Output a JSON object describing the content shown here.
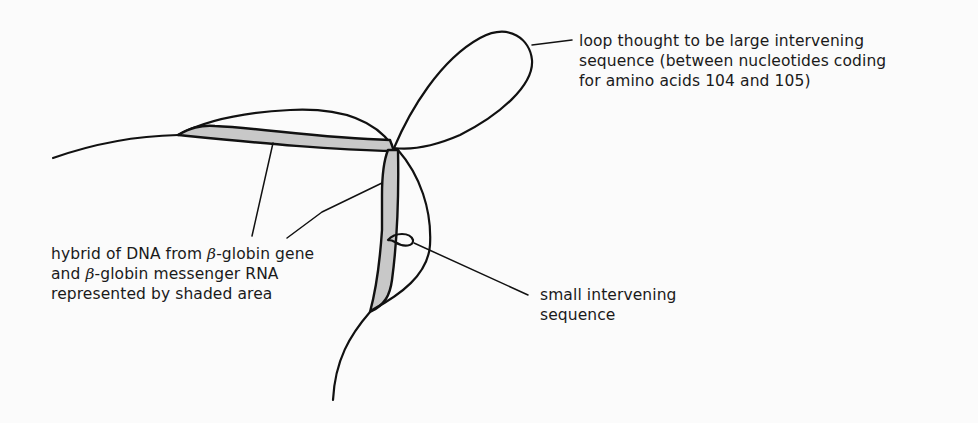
{
  "diagram": {
    "colors": {
      "stroke": "#111111",
      "shade": "#c8c8c8",
      "background": "#fbfbfb"
    },
    "labels": {
      "large_loop": {
        "lines": [
          "loop thought to be large intervening",
          "sequence (between nucleotides coding",
          "for amino acids 104 and 105)"
        ]
      },
      "hybrid": {
        "line1_pre": "hybrid of DNA from ",
        "line1_beta": "β",
        "line1_post": "-globin gene",
        "line2_pre": "and ",
        "line2_beta": "β",
        "line2_post": "-globin messenger RNA",
        "line3": "represented by shaded area"
      },
      "small_loop": {
        "lines": [
          "small intervening",
          "sequence"
        ]
      }
    }
  }
}
